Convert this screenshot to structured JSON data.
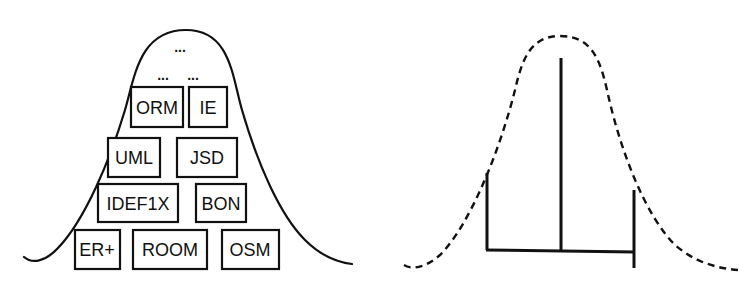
{
  "left_diagram": {
    "curve": "solid bell curve",
    "ellipsis_top": "...",
    "ellipsis_row": [
      "...",
      "..."
    ],
    "boxes": [
      {
        "label": "ORM",
        "x": 131,
        "y": 87,
        "w": 52,
        "h": 40
      },
      {
        "label": "IE",
        "x": 189,
        "y": 87,
        "w": 38,
        "h": 40
      },
      {
        "label": "UML",
        "x": 108,
        "y": 138,
        "w": 52,
        "h": 39
      },
      {
        "label": "JSD",
        "x": 177,
        "y": 138,
        "w": 60,
        "h": 39
      },
      {
        "label": "IDEF1X",
        "x": 98,
        "y": 184,
        "w": 80,
        "h": 38
      },
      {
        "label": "BON",
        "x": 196,
        "y": 184,
        "w": 50,
        "h": 38
      },
      {
        "label": "ER+",
        "x": 75,
        "y": 230,
        "w": 45,
        "h": 39
      },
      {
        "label": "ROOM",
        "x": 133,
        "y": 230,
        "w": 74,
        "h": 39
      },
      {
        "label": "OSM",
        "x": 222,
        "y": 230,
        "w": 57,
        "h": 39
      }
    ]
  },
  "right_diagram": {
    "curve": "dashed bell curve",
    "bars": {
      "left_bar": {
        "x": 487,
        "y1": 173,
        "y2": 250
      },
      "center_bar": {
        "x": 561,
        "y1": 58,
        "y2": 250
      },
      "right_bar": {
        "x": 634,
        "y1": 190,
        "y2": 268
      },
      "baseline": {
        "x1": 487,
        "y1": 250,
        "x2": 634,
        "y2": 252
      }
    }
  },
  "colors": {
    "ink": "#111111",
    "background": "#ffffff"
  }
}
